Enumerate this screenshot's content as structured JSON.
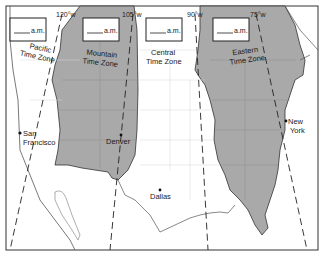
{
  "map": {
    "title": "U.S. Time Zones",
    "colors": {
      "shaded_zone": "#a9a9a9",
      "unshaded_zone": "#ffffff",
      "border": "#333333",
      "state_lines": "#d0d0d0"
    },
    "zones": [
      {
        "name_line1": "Pacific",
        "name_line2": "Time Zone",
        "time_box": "a.m.",
        "shaded": false
      },
      {
        "name_line1": "Mountain",
        "name_line2": "Time Zone",
        "time_box": "a.m.",
        "shaded": true
      },
      {
        "name_line1": "Central",
        "name_line2": "Time Zone",
        "time_box": "a.m.",
        "shaded": false
      },
      {
        "name_line1": "Eastern",
        "name_line2": "Time Zone",
        "time_box": "a.m.",
        "shaded": true
      }
    ],
    "meridians": [
      {
        "label": "120°w"
      },
      {
        "label": "105°w"
      },
      {
        "label": "90°w"
      },
      {
        "label": "75°w"
      }
    ],
    "cities": [
      {
        "name_line1": "San",
        "name_line2": "Francisco"
      },
      {
        "name_line1": "Denver",
        "name_line2": ""
      },
      {
        "name_line1": "Dallas",
        "name_line2": ""
      },
      {
        "name_line1": "New",
        "name_line2": "York"
      }
    ]
  }
}
